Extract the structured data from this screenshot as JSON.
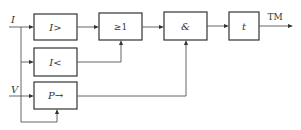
{
  "diagram": {
    "type": "logic-block-diagram",
    "inputs": [
      {
        "id": "I",
        "label": "I"
      },
      {
        "id": "V",
        "label": "V"
      }
    ],
    "blocks": [
      {
        "id": "overcurrent",
        "label": "I>"
      },
      {
        "id": "or_gate",
        "label": "≥1"
      },
      {
        "id": "and_gate",
        "label": "&"
      },
      {
        "id": "timer",
        "label": "t"
      },
      {
        "id": "undercurrent",
        "label": "I<"
      },
      {
        "id": "power_direction",
        "label": "P→"
      }
    ],
    "output": {
      "id": "TM",
      "label": "TM"
    },
    "connections": [
      [
        "I",
        "overcurrent"
      ],
      [
        "I",
        "undercurrent"
      ],
      [
        "I",
        "power_direction"
      ],
      [
        "V",
        "power_direction"
      ],
      [
        "overcurrent",
        "or_gate"
      ],
      [
        "undercurrent",
        "or_gate"
      ],
      [
        "or_gate",
        "and_gate"
      ],
      [
        "power_direction",
        "and_gate"
      ],
      [
        "and_gate",
        "timer"
      ],
      [
        "timer",
        "TM"
      ]
    ]
  }
}
